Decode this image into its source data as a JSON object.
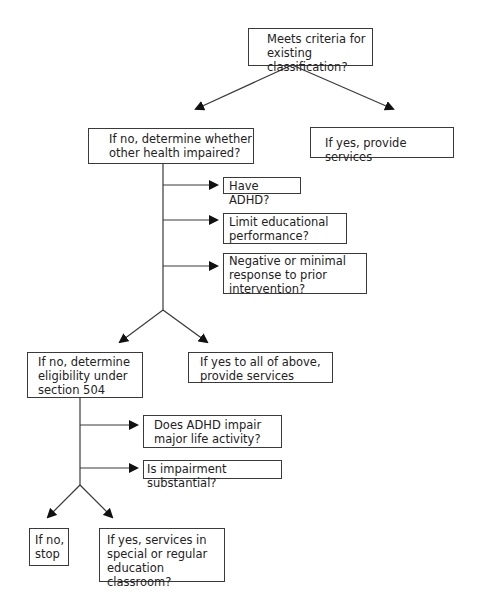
{
  "flowchart": {
    "nodes": {
      "start": "Meets criteria for\nexisting classification?",
      "ohi_check": "If no, determine whether\nother health impaired?",
      "yes_services": "If yes, provide services",
      "have_adhd": "Have ADHD?",
      "limit_edu": "Limit educational\nperformance?",
      "negative_response": "Negative or minimal\nresponse to prior\nintervention?",
      "section_504": "If no, determine\neligibility under\nsection 504",
      "yes_all_above": "If yes to all of above,\nprovide services",
      "impair_life": "Does ADHD impair\nmajor life activity?",
      "impair_substantial": "Is impairment substantial?",
      "no_stop": "If no,\nstop",
      "yes_classroom": "If yes, services in\nspecial or regular\neducation classroom?"
    },
    "colors": {
      "line": "#3a3a3a",
      "arrow": "#111111",
      "text": "#222222"
    }
  }
}
